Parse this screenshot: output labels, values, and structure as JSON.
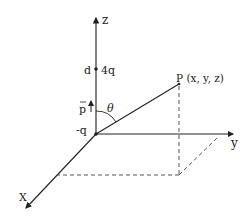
{
  "diagram": {
    "type": "3d-coordinate-dipole",
    "axes": {
      "z_label": "z",
      "y_label": "y",
      "x_label": "X"
    },
    "charges": {
      "origin_charge": "-q",
      "upper_charge": "4q",
      "upper_distance": "d"
    },
    "dipole_label": "p",
    "angle_label": "θ",
    "point_label": "P (x, y, z)",
    "colors": {
      "line": "#222222",
      "background": "#ffffff"
    }
  }
}
